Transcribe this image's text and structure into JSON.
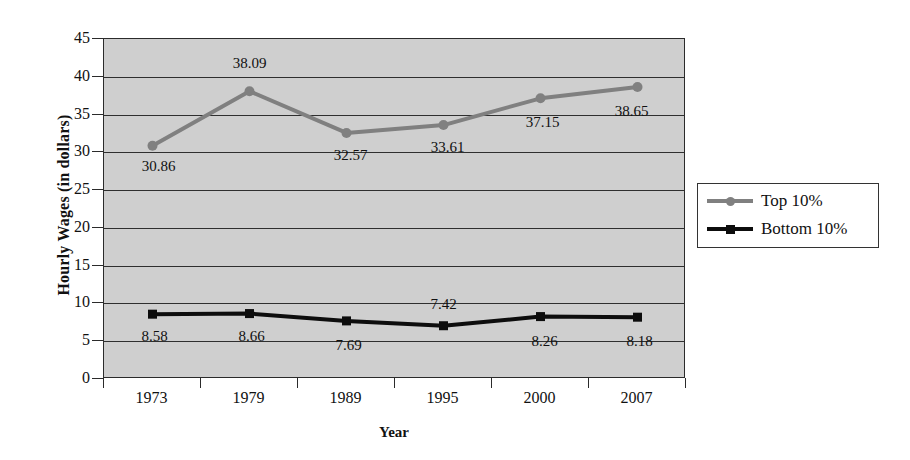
{
  "chart_data": {
    "type": "line",
    "title": "",
    "xlabel": "Year",
    "ylabel": "Hourly Wages (in dollars)",
    "categories": [
      "1973",
      "1979",
      "1989",
      "1995",
      "2000",
      "2007"
    ],
    "ylim": [
      0,
      45
    ],
    "ytick_labels": [
      "0",
      "5",
      "10",
      "15",
      "20",
      "25",
      "30",
      "35",
      "40",
      "45"
    ],
    "ytick_values": [
      0,
      5,
      10,
      15,
      20,
      25,
      30,
      35,
      40,
      45
    ],
    "grid": true,
    "legend_position": "right",
    "plot_background": "#cfcfcf",
    "series": [
      {
        "name": "Top 10%",
        "color": "#808080",
        "marker": "circle",
        "values": [
          30.86,
          38.09,
          32.57,
          33.61,
          37.15,
          38.65
        ],
        "labels": [
          "30.86",
          "38.09",
          "32.57",
          "33.61",
          "37.15",
          "38.65"
        ],
        "label_offsets": [
          {
            "dx": 6,
            "dy": 22
          },
          {
            "dx": 0,
            "dy": -26
          },
          {
            "dx": 4,
            "dy": 24
          },
          {
            "dx": 4,
            "dy": 24
          },
          {
            "dx": 2,
            "dy": 26
          },
          {
            "dx": -6,
            "dy": 26
          }
        ]
      },
      {
        "name": "Bottom 10%",
        "color": "#0d0d0d",
        "marker": "square",
        "values": [
          8.58,
          8.66,
          7.69,
          7.05,
          8.26,
          8.18
        ],
        "labels": [
          "8.58",
          "8.66",
          "7.69",
          "7.42",
          "8.26",
          "8.18"
        ],
        "label_offsets": [
          {
            "dx": 2,
            "dy": 24
          },
          {
            "dx": 2,
            "dy": 24
          },
          {
            "dx": 2,
            "dy": 26
          },
          {
            "dx": 0,
            "dy": -20
          },
          {
            "dx": 4,
            "dy": 26
          },
          {
            "dx": 2,
            "dy": 26
          }
        ]
      }
    ]
  },
  "legend": {
    "entries": [
      {
        "label": "Top 10%",
        "color": "#808080",
        "marker": "circle"
      },
      {
        "label": "Bottom 10%",
        "color": "#0d0d0d",
        "marker": "square"
      }
    ]
  }
}
